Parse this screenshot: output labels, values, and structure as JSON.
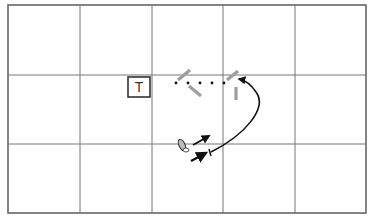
{
  "diagram": {
    "type": "drill-diagram",
    "grid": {
      "left": 8,
      "top": 5,
      "right": 366,
      "bottom": 213,
      "columns": [
        8,
        80,
        152,
        223,
        295,
        366
      ],
      "rows": [
        5,
        75,
        144,
        213
      ],
      "line_color": "#777777",
      "border_color": "#666666"
    },
    "target_box": {
      "label": "T",
      "x": 128,
      "y": 77,
      "w": 22,
      "h": 20
    },
    "dotted_path": {
      "y": 83,
      "dots_x": [
        176,
        188,
        200,
        212,
        224
      ]
    },
    "gray_markers": [
      {
        "x1": 178,
        "y1": 80,
        "x2": 190,
        "y2": 70
      },
      {
        "x1": 189,
        "y1": 86,
        "x2": 201,
        "y2": 96
      },
      {
        "x1": 227,
        "y1": 80,
        "x2": 238,
        "y2": 71
      },
      {
        "x1": 236,
        "y1": 87,
        "x2": 236,
        "y2": 100
      }
    ],
    "marker_color": "#9e9e9e",
    "curve_arrow": {
      "path": "M 211 152 C 245 135, 268 108, 256 92 C 250 83, 244 80, 239 79"
    },
    "player": {
      "x": 183,
      "y": 147
    },
    "short_arrow": {
      "x1": 193,
      "y1": 145,
      "x2": 209,
      "y2": 136
    },
    "lower_arrow": {
      "x1": 191,
      "y1": 161,
      "x2": 206,
      "y2": 153
    }
  }
}
